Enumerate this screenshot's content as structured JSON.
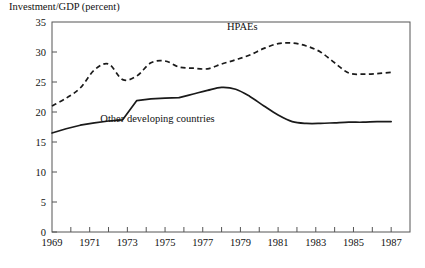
{
  "chart_data": {
    "type": "line",
    "title": "Investment/GDP (percent)",
    "xlabel": "",
    "ylabel": "Investment/GDP (percent)",
    "xlim": [
      1969,
      1988
    ],
    "ylim": [
      0,
      35
    ],
    "ytick_step": 5,
    "xtick_step": 1,
    "grid": false,
    "legend_position": "inline-annotation",
    "yticks": [
      0,
      5,
      10,
      15,
      20,
      25,
      30,
      35
    ],
    "ytick_labels": [
      "0",
      "5",
      "10",
      "15",
      "20",
      "25",
      "30",
      "35"
    ],
    "xticks": [
      1969,
      1970,
      1971,
      1972,
      1973,
      1974,
      1975,
      1976,
      1977,
      1978,
      1979,
      1980,
      1981,
      1982,
      1983,
      1984,
      1985,
      1986,
      1987,
      1988
    ],
    "xtick_labels": [
      "1969",
      "",
      "1971",
      "",
      "1973",
      "",
      "1975",
      "",
      "1977",
      "",
      "1979",
      "",
      "1981",
      "",
      "1983",
      "",
      "1985",
      "",
      "1987",
      ""
    ],
    "x": [
      1969,
      1970,
      1971,
      1972,
      1973,
      1974,
      1975,
      1976,
      1977,
      1978,
      1979,
      1980,
      1981,
      1982,
      1983,
      1984,
      1985,
      1986,
      1987,
      1988
    ],
    "series": [
      {
        "name": "HPAEs",
        "style": "dashed",
        "color": "#1a1a1a",
        "label_x": 1979.1,
        "label_y": 33.6,
        "values": [
          21.0,
          22.3,
          24.0,
          27.0,
          28.0,
          25.4,
          26.0,
          28.2,
          28.5,
          27.5,
          27.3,
          27.2,
          28.0,
          28.7,
          29.5,
          30.6,
          31.4,
          31.5,
          31.0,
          30.0
        ]
      },
      {
        "name": "Other developing countries",
        "style": "solid",
        "color": "#1a1a1a",
        "label_x": 1974.6,
        "label_y": 18.4,
        "values": [
          16.5,
          17.2,
          17.8,
          18.2,
          18.5,
          18.7,
          21.9,
          22.2,
          22.3,
          22.4,
          23.0,
          23.6,
          24.1,
          23.8,
          22.6,
          21.0,
          19.5,
          18.4,
          18.2,
          18.2
        ]
      }
    ],
    "series_tail": [
      {
        "name": "HPAEs",
        "values_extra": [
          28.2,
          26.5,
          26.3,
          26.5,
          26.6
        ]
      },
      {
        "name": "Other developing countries",
        "values_extra": [
          18.2,
          18.1,
          18.2,
          18.3,
          18.4
        ]
      }
    ],
    "hpaes_full": [
      21.0,
      22.3,
      24.0,
      27.0,
      28.0,
      25.4,
      26.0,
      28.2,
      28.5,
      27.5,
      27.3,
      27.2,
      28.0,
      28.7,
      29.5,
      30.6,
      31.4,
      31.5,
      31.0,
      30.0,
      28.2,
      26.5,
      26.3,
      26.4,
      26.6
    ],
    "other_full": [
      16.5,
      17.2,
      17.8,
      18.2,
      18.5,
      18.7,
      21.9,
      22.2,
      22.3,
      22.4,
      23.0,
      23.6,
      24.1,
      23.8,
      22.6,
      21.0,
      19.5,
      18.4,
      18.1,
      18.1,
      18.2,
      18.3,
      18.3,
      18.4,
      18.4
    ],
    "x_full": [
      1969,
      1969.75,
      1970.5,
      1971.25,
      1972,
      1972.75,
      1973.5,
      1974.25,
      1975,
      1975.75,
      1976.5,
      1977.25,
      1978,
      1978.75,
      1979.5,
      1980.25,
      1981,
      1981.75,
      1982.5,
      1983.25,
      1984,
      1984.75,
      1985.5,
      1986.25,
      1987
    ]
  }
}
